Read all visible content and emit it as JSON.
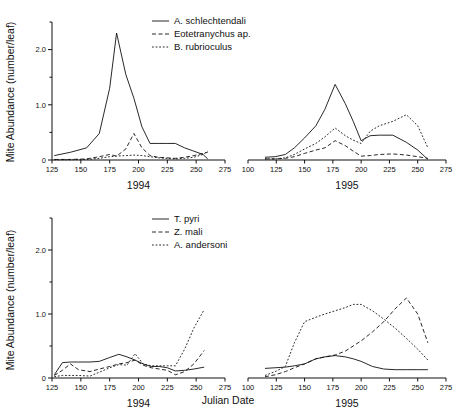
{
  "figure": {
    "ylabel": "Mite Abundance (number/leaf)",
    "xlabel": "Julian Date",
    "panel_labels": {
      "left": "1994",
      "right": "1995"
    },
    "caption": ""
  },
  "chart_data": [
    {
      "type": "line",
      "id": "pest-mites-1994",
      "title": "",
      "xlabel": "1994",
      "ylabel": "Mite Abundance (number/leaf)",
      "xlim": [
        125,
        275
      ],
      "ylim": [
        0,
        2.5
      ],
      "xticks": [
        125,
        150,
        175,
        200,
        225,
        250,
        275
      ],
      "yticks": [
        0,
        1.0,
        2.0
      ],
      "ytick_labels": [
        "0",
        "1.0",
        "2.0"
      ],
      "minor_yticks": [
        0.5,
        1.5,
        2.5
      ],
      "grid": false,
      "legend_position": "top-right",
      "series": [
        {
          "name": "A. schlechtendali",
          "style": "solid",
          "x": [
            127,
            141,
            155,
            166,
            175,
            181,
            189,
            196,
            203,
            210,
            217,
            224,
            232,
            240,
            248,
            256,
            260
          ],
          "values": [
            0.08,
            0.14,
            0.22,
            0.48,
            1.3,
            2.3,
            1.55,
            1.12,
            0.6,
            0.3,
            0.3,
            0.3,
            0.3,
            0.22,
            0.16,
            0.1,
            0.02
          ]
        },
        {
          "name": "Eotetranychus ap.",
          "style": "dashed",
          "x": [
            127,
            141,
            155,
            166,
            175,
            181,
            189,
            196,
            203,
            210,
            217,
            224,
            232,
            240,
            248,
            256,
            260
          ],
          "values": [
            0.01,
            0.01,
            0.02,
            0.06,
            0.1,
            0.07,
            0.2,
            0.48,
            0.22,
            0.08,
            0.05,
            0.04,
            0.03,
            0.05,
            0.08,
            0.12,
            0.14
          ]
        },
        {
          "name": "B. rubrioculus",
          "style": "dotted",
          "x": [
            127,
            141,
            155,
            166,
            175,
            181,
            189,
            196,
            203,
            210,
            217,
            224,
            232,
            240,
            248,
            256,
            260
          ],
          "values": [
            0.005,
            0.005,
            0.01,
            0.03,
            0.06,
            0.07,
            0.08,
            0.09,
            0.08,
            0.06,
            0.04,
            0.03,
            0.02,
            0.03,
            0.05,
            0.1,
            0.16
          ]
        }
      ]
    },
    {
      "type": "line",
      "id": "pest-mites-1995",
      "title": "",
      "xlabel": "1995",
      "ylabel": "Mite Abundance (number/leaf)",
      "xlim": [
        100,
        275
      ],
      "ylim": [
        0,
        2.5
      ],
      "xticks": [
        100,
        125,
        150,
        175,
        200,
        225,
        250,
        275
      ],
      "yticks": [
        0,
        1.0,
        2.0
      ],
      "grid": false,
      "legend_position": "shared-top-left-panel",
      "series": [
        {
          "name": "A. schlechtendali",
          "style": "solid",
          "x": [
            115,
            124,
            133,
            141,
            150,
            160,
            168,
            177,
            186,
            193,
            200,
            208,
            216,
            228,
            240,
            250,
            259
          ],
          "values": [
            0.05,
            0.06,
            0.1,
            0.22,
            0.4,
            0.62,
            0.92,
            1.37,
            1.02,
            0.7,
            0.35,
            0.44,
            0.45,
            0.45,
            0.32,
            0.18,
            0.01
          ]
        },
        {
          "name": "Eotetranychus ap.",
          "style": "dashed",
          "x": [
            115,
            124,
            133,
            141,
            150,
            160,
            168,
            177,
            186,
            193,
            200,
            208,
            216,
            228,
            240,
            250,
            259
          ],
          "values": [
            0.02,
            0.02,
            0.03,
            0.06,
            0.12,
            0.18,
            0.22,
            0.35,
            0.26,
            0.16,
            0.07,
            0.08,
            0.1,
            0.11,
            0.09,
            0.06,
            0.03
          ]
        },
        {
          "name": "B. rubrioculus",
          "style": "dotted",
          "x": [
            115,
            124,
            133,
            141,
            150,
            160,
            168,
            177,
            186,
            193,
            200,
            208,
            216,
            228,
            240,
            250,
            259
          ],
          "values": [
            0.02,
            0.02,
            0.04,
            0.1,
            0.2,
            0.3,
            0.42,
            0.58,
            0.44,
            0.36,
            0.3,
            0.52,
            0.62,
            0.7,
            0.82,
            0.62,
            0.22
          ]
        }
      ]
    },
    {
      "type": "line",
      "id": "predator-mites-1994",
      "title": "",
      "xlabel": "1994",
      "ylabel": "Mite Abundance (number/leaf)",
      "xlim": [
        125,
        275
      ],
      "ylim": [
        0,
        2.5
      ],
      "xticks": [
        125,
        150,
        175,
        200,
        225,
        250,
        275
      ],
      "yticks": [
        0,
        1.0,
        2.0
      ],
      "ytick_labels": [
        "0",
        "1.0",
        "2.0"
      ],
      "grid": false,
      "legend_position": "top-right",
      "series": [
        {
          "name": "T. pyri",
          "style": "solid",
          "x": [
            127,
            134,
            141,
            148,
            158,
            166,
            175,
            183,
            190,
            197,
            204,
            211,
            218,
            225,
            232,
            240,
            248,
            257
          ],
          "values": [
            0.05,
            0.24,
            0.25,
            0.25,
            0.25,
            0.26,
            0.32,
            0.37,
            0.33,
            0.28,
            0.22,
            0.18,
            0.18,
            0.16,
            0.11,
            0.12,
            0.14,
            0.17
          ]
        },
        {
          "name": "Z. mali",
          "style": "dashed",
          "x": [
            127,
            134,
            141,
            148,
            158,
            166,
            175,
            183,
            190,
            197,
            204,
            211,
            218,
            225,
            232,
            240,
            248,
            257
          ],
          "values": [
            0.04,
            0.12,
            0.22,
            0.13,
            0.1,
            0.14,
            0.18,
            0.22,
            0.24,
            0.28,
            0.2,
            0.16,
            0.14,
            0.12,
            0.05,
            0.1,
            0.22,
            0.43
          ]
        },
        {
          "name": "A. andersoni",
          "style": "dotted",
          "x": [
            127,
            134,
            141,
            148,
            158,
            166,
            175,
            183,
            190,
            197,
            204,
            211,
            218,
            225,
            232,
            240,
            248,
            257
          ],
          "values": [
            0.02,
            0.04,
            0.04,
            0.04,
            0.03,
            0.09,
            0.16,
            0.21,
            0.2,
            0.38,
            0.22,
            0.19,
            0.19,
            0.19,
            0.19,
            0.45,
            0.78,
            1.07
          ]
        }
      ]
    },
    {
      "type": "line",
      "id": "predator-mites-1995",
      "title": "",
      "xlabel": "1995",
      "ylabel": "Mite Abundance (number/leaf)",
      "xlim": [
        100,
        275
      ],
      "ylim": [
        0,
        2.5
      ],
      "xticks": [
        100,
        125,
        150,
        175,
        200,
        225,
        250,
        275
      ],
      "yticks": [
        0,
        1.0,
        2.0
      ],
      "grid": false,
      "legend_position": "shared-bottom-left-panel",
      "series": [
        {
          "name": "T. pyri",
          "style": "solid",
          "x": [
            115,
            124,
            133,
            141,
            150,
            160,
            168,
            177,
            186,
            193,
            200,
            210,
            220,
            230,
            240,
            250,
            259
          ],
          "values": [
            0.15,
            0.16,
            0.17,
            0.19,
            0.22,
            0.3,
            0.33,
            0.35,
            0.33,
            0.3,
            0.26,
            0.18,
            0.14,
            0.13,
            0.13,
            0.13,
            0.13
          ]
        },
        {
          "name": "Z. mali",
          "style": "dashed",
          "x": [
            115,
            124,
            133,
            141,
            150,
            160,
            168,
            177,
            186,
            193,
            200,
            210,
            220,
            230,
            240,
            250,
            259
          ],
          "values": [
            0.02,
            0.05,
            0.1,
            0.16,
            0.22,
            0.3,
            0.33,
            0.36,
            0.42,
            0.5,
            0.58,
            0.72,
            0.88,
            1.08,
            1.25,
            1.0,
            0.55
          ]
        },
        {
          "name": "A. andersoni",
          "style": "dotted",
          "x": [
            115,
            124,
            133,
            141,
            150,
            160,
            168,
            177,
            186,
            193,
            200,
            210,
            220,
            230,
            240,
            250,
            259
          ],
          "values": [
            0.04,
            0.1,
            0.18,
            0.55,
            0.88,
            0.95,
            1.0,
            1.05,
            1.1,
            1.15,
            1.15,
            1.05,
            0.92,
            0.78,
            0.62,
            0.45,
            0.28
          ]
        }
      ]
    }
  ],
  "legends": {
    "top": [
      {
        "label": "A. schlechtendali",
        "style": "solid"
      },
      {
        "label": "Eotetranychus ap.",
        "style": "dashed"
      },
      {
        "label": "B. rubrioculus",
        "style": "dotted"
      }
    ],
    "bottom": [
      {
        "label": "T. pyri",
        "style": "solid"
      },
      {
        "label": "Z. mali",
        "style": "dashed"
      },
      {
        "label": "A. andersoni",
        "style": "dotted"
      }
    ]
  },
  "axis_text": {
    "top_left_yticks": [
      "2.0",
      "1.0",
      "0"
    ],
    "bottom_left_yticks": [
      "2.0",
      "1.0",
      "0"
    ],
    "top_left_xticks": [
      "125",
      "150",
      "175",
      "200",
      "225",
      "250",
      "275"
    ],
    "top_right_xticks": [
      "100",
      "125",
      "150",
      "175",
      "200",
      "225",
      "250",
      "275"
    ],
    "bottom_left_xticks": [
      "125",
      "150",
      "175",
      "200",
      "225",
      "250",
      "275"
    ],
    "bottom_right_xticks": [
      "100",
      "125",
      "150",
      "175",
      "200",
      "225",
      "250",
      "275"
    ]
  }
}
